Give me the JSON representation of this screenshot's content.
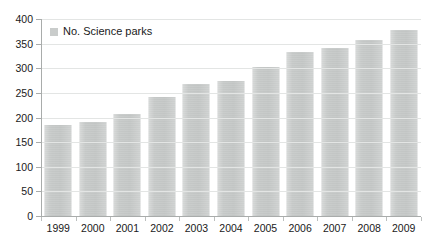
{
  "chart_data": {
    "type": "bar",
    "title": "",
    "xlabel": "",
    "ylabel": "",
    "categories": [
      "1999",
      "2000",
      "2001",
      "2002",
      "2003",
      "2004",
      "2005",
      "2006",
      "2007",
      "2008",
      "2009"
    ],
    "values": [
      185,
      190,
      207,
      241,
      268,
      274,
      303,
      333,
      342,
      358,
      378
    ],
    "series": [
      {
        "name": "No. Science parks",
        "values": [
          185,
          190,
          207,
          241,
          268,
          274,
          303,
          333,
          342,
          358,
          378
        ]
      }
    ],
    "ylim": [
      0,
      400
    ],
    "y_ticks": [
      0,
      50,
      100,
      150,
      200,
      250,
      300,
      350,
      400
    ],
    "y_tick_labels": [
      "0",
      "50",
      "100",
      "150",
      "200",
      "250",
      "300",
      "350",
      "400"
    ],
    "grid": true,
    "grid_axis": "y",
    "legend": {
      "position": "top-left-inside",
      "entries": [
        {
          "label": "No. Science parks",
          "color": "#c9cccb"
        }
      ]
    },
    "colors": {
      "bar": "#c9cccb",
      "axis": "#a9acab",
      "grid": "#e3e5e4",
      "text": "#1a1a1a",
      "background": "#ffffff"
    }
  }
}
